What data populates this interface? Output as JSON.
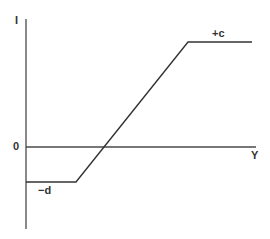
{
  "diagram": {
    "type": "piecewise-linear saturation function",
    "y_axis_label": "I",
    "x_axis_label": "Y",
    "origin_label": "0",
    "upper_level_label": "+c",
    "lower_level_label": "−d",
    "colors": {
      "background": "#ffffff",
      "line": "#333333",
      "axis": "#4a4a4a"
    },
    "geometry": {
      "y_axis": {
        "x": 26,
        "y1": 19,
        "y2": 229
      },
      "x_axis": {
        "y": 147,
        "x1": 26,
        "x2": 256
      },
      "curve_points": [
        [
          26,
          182
        ],
        [
          76,
          182
        ],
        [
          188,
          42
        ],
        [
          252,
          42
        ]
      ]
    }
  }
}
